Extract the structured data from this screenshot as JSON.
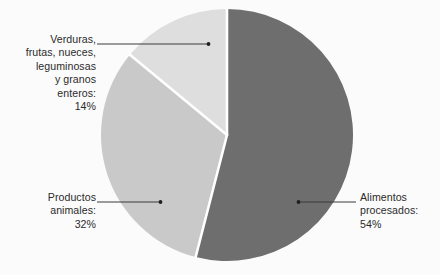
{
  "chart_data": {
    "type": "pie",
    "title": "",
    "subtitle": "",
    "xlabel": "",
    "ylabel": "",
    "grid": false,
    "legend_position": "callout-labels",
    "units": "percent",
    "start_angle_deg": 0,
    "direction": "clockwise",
    "categories": [
      "Alimentos procesados",
      "Productos animales",
      "Verduras, frutas, nueces, leguminosas y granos enteros"
    ],
    "values": [
      54,
      32,
      14
    ],
    "slices": [
      {
        "id": "processed",
        "label": "Alimentos\nprocesados:",
        "label_full": "Alimentos procesados",
        "value": 54,
        "value_text": "54%",
        "color": "#6e6e6e",
        "start_deg": 0,
        "end_deg": 194.4
      },
      {
        "id": "animal",
        "label": "Productos\nanimales:",
        "label_full": "Productos animales",
        "value": 32,
        "value_text": "32%",
        "color": "#c9c9c9",
        "start_deg": 194.4,
        "end_deg": 309.6
      },
      {
        "id": "vegetal",
        "label": "Verduras,\nfrutas, nueces,\nleguminosas\ny granos\nenteros:",
        "label_full": "Verduras, frutas, nueces, leguminosas y granos enteros",
        "value": 14,
        "value_text": "14%",
        "color": "#dedede",
        "start_deg": 309.6,
        "end_deg": 360
      }
    ]
  },
  "callouts": {
    "vegetal": {
      "text": "Verduras,\nfrutas, nueces,\nleguminosas\ny granos\nenteros:\n14%"
    },
    "animal": {
      "text": "Productos\nanimales:\n32%"
    },
    "processed": {
      "text": "Alimentos\nprocesados:\n54%"
    }
  },
  "colors": {
    "background": "#fbfbfb",
    "slice_processed": "#6e6e6e",
    "slice_animal": "#c9c9c9",
    "slice_vegetal": "#dedede",
    "separator": "#ffffff",
    "leader_line": "#3a3a3a",
    "text": "#2b2b2b"
  }
}
